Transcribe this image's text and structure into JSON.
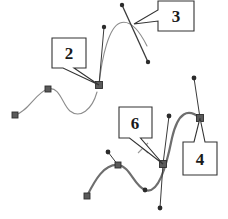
{
  "figure": {
    "width": 228,
    "height": 219,
    "background_color": "#ffffff"
  },
  "colors": {
    "curve_light": "#8c8c8c",
    "curve_dark": "#6e6e6e",
    "handle_line": "#3a3a3a",
    "anchor_square_fill": "#5a5a5a",
    "anchor_square_stroke": "#2e2e2e",
    "control_dot": "#2b2b2b",
    "callout_border": "#333333",
    "callout_fill": "#ffffff",
    "label_text": "#1a1a1a",
    "cursor_mark": "#9a9a9a"
  },
  "callouts": [
    {
      "id": "callout-2",
      "label": "2",
      "box": {
        "x": 52,
        "y": 38,
        "w": 34,
        "h": 30
      },
      "text_x": 69,
      "text_y": 53,
      "font_size": 17,
      "pointer_target": {
        "x": 99,
        "y": 85
      }
    },
    {
      "id": "callout-3",
      "label": "3",
      "box": {
        "x": 158,
        "y": 1,
        "w": 36,
        "h": 30
      },
      "text_x": 176,
      "text_y": 16,
      "font_size": 17,
      "pointer_target": {
        "x": 134,
        "y": 24
      }
    },
    {
      "id": "callout-4",
      "label": "4",
      "box": {
        "x": 183,
        "y": 142,
        "w": 34,
        "h": 33
      },
      "text_x": 200,
      "text_y": 159,
      "font_size": 17,
      "pointer_target": {
        "x": 200,
        "y": 118
      }
    },
    {
      "id": "callout-6",
      "label": "6",
      "box": {
        "x": 119,
        "y": 107,
        "w": 33,
        "h": 31
      },
      "text_x": 135,
      "text_y": 123,
      "font_size": 17,
      "pointer_target": {
        "x": 163,
        "y": 164
      }
    }
  ],
  "cursor_marks": [
    {
      "id": "x-cursor",
      "x": 143,
      "y": 148,
      "size": 5
    }
  ],
  "paths": [
    {
      "id": "path-upper-left",
      "stroke": "#8c8c8c",
      "stroke_width": 1.1,
      "d": "M 15,115 C 28,112 36,92 48,89 C 60,86 62,104 70,111 C 80,119 92,110 97,92"
    },
    {
      "id": "path-upper-right",
      "stroke": "#8c8c8c",
      "stroke_width": 1.1,
      "d": "M 99,85 C 102,56 109,27 120,23 C 131,19 140,32 147,46"
    },
    {
      "id": "path-lower",
      "stroke": "#6e6e6e",
      "stroke_width": 2.2,
      "d": "M 87,196 C 95,180 104,164 118,165 C 130,166 134,186 145,190 C 158,195 166,168 172,138 C 178,112 188,108 200,118"
    }
  ],
  "handle_lines": [
    {
      "id": "handle-2-upper",
      "x1": 99,
      "y1": 85,
      "x2": 104,
      "y2": 27,
      "stroke": "#3a3a3a",
      "stroke_width": 1.0
    },
    {
      "id": "handle-3-diagonal",
      "x1": 122,
      "y1": 5,
      "x2": 148,
      "y2": 62,
      "stroke": "#3a3a3a",
      "stroke_width": 1.3
    },
    {
      "id": "handle-4-upper",
      "x1": 200,
      "y1": 118,
      "x2": 194,
      "y2": 78,
      "stroke": "#3a3a3a",
      "stroke_width": 1.0
    },
    {
      "id": "handle-6-upper",
      "x1": 163,
      "y1": 164,
      "x2": 169,
      "y2": 116,
      "stroke": "#3a3a3a",
      "stroke_width": 1.0
    },
    {
      "id": "handle-6-lower",
      "x1": 163,
      "y1": 164,
      "x2": 160,
      "y2": 208,
      "stroke": "#3a3a3a",
      "stroke_width": 1.0
    },
    {
      "id": "handle-lower-mid",
      "x1": 118,
      "y1": 165,
      "x2": 108,
      "y2": 152,
      "stroke": "#3a3a3a",
      "stroke_width": 1.0
    }
  ],
  "anchor_points": [
    {
      "id": "anchor-left-end",
      "x": 15,
      "y": 115,
      "size": 6
    },
    {
      "id": "anchor-left-mid",
      "x": 48,
      "y": 89,
      "size": 6
    },
    {
      "id": "anchor-2-joint",
      "x": 99,
      "y": 85,
      "size": 7
    },
    {
      "id": "anchor-4-right",
      "x": 200,
      "y": 118,
      "size": 7
    },
    {
      "id": "anchor-6-joint",
      "x": 163,
      "y": 164,
      "size": 7
    },
    {
      "id": "anchor-lower-mid",
      "x": 118,
      "y": 165,
      "size": 6
    },
    {
      "id": "anchor-lower-left-end",
      "x": 87,
      "y": 196,
      "size": 6
    }
  ],
  "control_points": [
    {
      "id": "control-2-top",
      "x": 104,
      "y": 27,
      "r": 2.2
    },
    {
      "id": "control-3-top",
      "x": 122,
      "y": 5,
      "r": 2.2
    },
    {
      "id": "control-3-bottom",
      "x": 148,
      "y": 62,
      "r": 2.2
    },
    {
      "id": "control-4-top",
      "x": 194,
      "y": 78,
      "r": 2.4
    },
    {
      "id": "control-6-top",
      "x": 169,
      "y": 116,
      "r": 2.4
    },
    {
      "id": "control-6-bottom",
      "x": 160,
      "y": 208,
      "r": 2.4
    },
    {
      "id": "control-lower-peak",
      "x": 108,
      "y": 152,
      "r": 2.4
    },
    {
      "id": "control-lower-valley",
      "x": 145,
      "y": 190,
      "r": 2.4
    }
  ]
}
